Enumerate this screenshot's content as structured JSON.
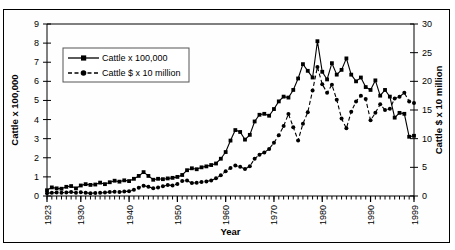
{
  "chart_data": {
    "type": "line",
    "title": "",
    "xlabel": "Year",
    "ylabel": "Cattle x 100,000",
    "y2label": "Cattle $ x 10 million",
    "xlim": [
      1923,
      1999
    ],
    "ylim": [
      0,
      9
    ],
    "y2lim": [
      0,
      30
    ],
    "grid": false,
    "legend_position": "upper-left",
    "xticks": [
      1923,
      1930,
      1940,
      1950,
      1960,
      1970,
      1980,
      1990,
      1999
    ],
    "xtick_labels": [
      "1923",
      "1930",
      "1940",
      "1950",
      "1960",
      "1970",
      "1980",
      "1990",
      "1999"
    ],
    "yticks": [
      0,
      1,
      2,
      3,
      4,
      5,
      6,
      7,
      8,
      9
    ],
    "ytick_labels": [
      "0",
      "1",
      "2",
      "3",
      "4",
      "5",
      "6",
      "7",
      "8",
      "9"
    ],
    "y2ticks": [
      0,
      5,
      10,
      15,
      20,
      25,
      30
    ],
    "y2tick_labels": [
      "0",
      "5",
      "10",
      "15",
      "20",
      "25",
      "30"
    ],
    "minor_xticks_every": 1,
    "x": [
      1923,
      1924,
      1925,
      1926,
      1927,
      1928,
      1929,
      1930,
      1931,
      1932,
      1933,
      1934,
      1935,
      1936,
      1937,
      1938,
      1939,
      1940,
      1941,
      1942,
      1943,
      1944,
      1945,
      1946,
      1947,
      1948,
      1949,
      1950,
      1951,
      1952,
      1953,
      1954,
      1955,
      1956,
      1957,
      1958,
      1959,
      1960,
      1961,
      1962,
      1963,
      1964,
      1965,
      1966,
      1967,
      1968,
      1969,
      1970,
      1971,
      1972,
      1973,
      1974,
      1975,
      1976,
      1977,
      1978,
      1979,
      1980,
      1981,
      1982,
      1983,
      1984,
      1985,
      1986,
      1987,
      1988,
      1989,
      1990,
      1991,
      1992,
      1993,
      1994,
      1995,
      1996,
      1997,
      1998,
      1999
    ],
    "series": [
      {
        "name": "Cattle x 100,000",
        "axis": "left",
        "marker": "square",
        "linestyle": "solid",
        "color": "#000000",
        "values": [
          0.3,
          0.45,
          0.4,
          0.38,
          0.48,
          0.52,
          0.4,
          0.55,
          0.62,
          0.58,
          0.6,
          0.7,
          0.62,
          0.72,
          0.8,
          0.75,
          0.82,
          0.78,
          0.9,
          1.05,
          1.25,
          1.05,
          0.85,
          0.9,
          0.88,
          0.92,
          0.95,
          1.0,
          1.1,
          1.35,
          1.45,
          1.4,
          1.5,
          1.55,
          1.62,
          1.7,
          1.95,
          2.3,
          2.9,
          3.45,
          3.35,
          2.95,
          3.2,
          3.9,
          4.25,
          4.3,
          4.2,
          4.55,
          4.95,
          5.2,
          5.15,
          5.55,
          6.15,
          6.9,
          6.55,
          6.2,
          8.1,
          6.5,
          6.1,
          6.95,
          6.35,
          6.6,
          7.2,
          6.35,
          6.0,
          6.2,
          5.7,
          5.55,
          6.05,
          5.25,
          5.55,
          5.2,
          4.1,
          4.35,
          4.3,
          3.1,
          3.15
        ]
      },
      {
        "name": "Cattle $ x 10 million",
        "axis": "right",
        "marker": "circle",
        "linestyle": "dashed",
        "color": "#000000",
        "values": [
          0.5,
          0.55,
          0.6,
          0.58,
          0.62,
          0.7,
          0.58,
          0.65,
          0.55,
          0.5,
          0.52,
          0.55,
          0.6,
          0.7,
          0.75,
          0.7,
          0.78,
          0.85,
          1.1,
          1.45,
          1.8,
          1.6,
          1.35,
          1.5,
          1.7,
          1.9,
          1.85,
          2.1,
          2.6,
          2.7,
          2.25,
          2.3,
          2.45,
          2.55,
          2.7,
          3.1,
          3.6,
          4.3,
          4.9,
          5.3,
          5.1,
          4.7,
          5.2,
          6.5,
          7.2,
          7.6,
          8.2,
          9.3,
          10.6,
          12.2,
          14.3,
          12.0,
          9.7,
          12.6,
          14.6,
          18.4,
          22.5,
          19.5,
          18.0,
          19.4,
          16.8,
          13.5,
          11.8,
          14.7,
          16.5,
          17.5,
          16.9,
          13.2,
          14.5,
          16.0,
          15.0,
          15.2,
          17.0,
          17.3,
          18.0,
          16.5,
          16.2
        ]
      }
    ]
  },
  "axes": {
    "left_title": "Cattle x 100,000",
    "right_title": "Cattle $ x 10 million",
    "bottom_title": "Year"
  },
  "legend": {
    "items": [
      {
        "label": "Cattle x 100,000",
        "marker": "square-marker-icon",
        "linestyle": "solid"
      },
      {
        "label": "Cattle $ x 10 million",
        "marker": "circle-marker-icon",
        "linestyle": "dashed"
      }
    ]
  }
}
